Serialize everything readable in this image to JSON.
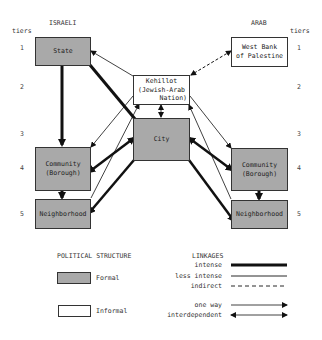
{
  "headers": {
    "left_title": "ISRAELI",
    "right_title": "ARAB",
    "tiers_label_left": "tiers",
    "tiers_label_right": "tiers"
  },
  "tiers": [
    "1",
    "2",
    "3",
    "4",
    "5"
  ],
  "nodes": {
    "state": {
      "label": "State",
      "type": "formal"
    },
    "west_bank": {
      "line1": "West Bank",
      "line2": "of Palestine",
      "type": "informal"
    },
    "kehillot": {
      "line1": "Kehillot",
      "line2": "(Jewish-Arab",
      "line3": "Nation)",
      "type": "informal"
    },
    "city": {
      "label": "City",
      "type": "formal"
    },
    "community_left": {
      "line1": "Community",
      "line2": "(Borough)",
      "type": "formal"
    },
    "neighborhood_left": {
      "label": "Neighborhood",
      "type": "formal"
    },
    "community_right": {
      "line1": "Community",
      "line2": "(Borough)",
      "type": "formal"
    },
    "neighborhood_right": {
      "label": "Neighborhood",
      "type": "formal"
    }
  },
  "links": [
    {
      "from": "state",
      "to": "community_left",
      "style": "intense",
      "direction": "one way"
    },
    {
      "from": "state",
      "to": "city",
      "style": "intense",
      "direction": "one way"
    },
    {
      "from": "kehillot",
      "to": "state",
      "style": "less intense",
      "direction": "one way"
    },
    {
      "from": "west_bank",
      "to": "kehillot",
      "style": "indirect",
      "direction": "one way"
    },
    {
      "from": "kehillot",
      "to": "city",
      "style": "less intense",
      "direction": "interdependent"
    },
    {
      "from": "community_left",
      "to": "neighborhood_left",
      "style": "intense",
      "direction": "one way"
    },
    {
      "from": "community_right",
      "to": "neighborhood_right",
      "style": "intense",
      "direction": "one way"
    },
    {
      "from": "city",
      "to": "community_left",
      "style": "intense",
      "direction": "interdependent"
    },
    {
      "from": "city",
      "to": "community_right",
      "style": "intense",
      "direction": "interdependent"
    },
    {
      "from": "city",
      "to": "neighborhood_left",
      "style": "intense",
      "direction": "one way"
    },
    {
      "from": "city",
      "to": "neighborhood_right",
      "style": "intense",
      "direction": "one way"
    },
    {
      "from": "kehillot",
      "to": "community_left",
      "style": "less intense",
      "direction": "one way"
    },
    {
      "from": "neighborhood_left",
      "to": "kehillot",
      "style": "less intense",
      "direction": "one way"
    },
    {
      "from": "kehillot",
      "to": "community_right",
      "style": "less intense",
      "direction": "one way"
    },
    {
      "from": "neighborhood_right",
      "to": "kehillot",
      "style": "less intense",
      "direction": "one way"
    }
  ],
  "legend": {
    "structure_title": "POLITICAL STRUCTURE",
    "formal": "Formal",
    "informal": "Informal",
    "linkages_title": "LINKAGES",
    "intense": "intense",
    "less_intense": "less intense",
    "indirect": "indirect",
    "one_way": "one way",
    "interdependent": "interdependent"
  },
  "colors": {
    "formal_fill": "#a9a9a9",
    "informal_fill": "#ffffff",
    "line": "#111111"
  }
}
